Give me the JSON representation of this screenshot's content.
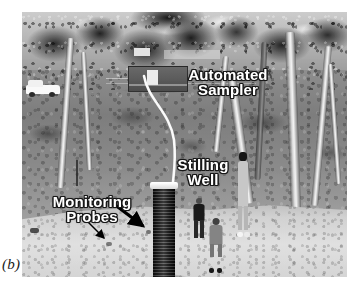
{
  "figure": {
    "sublabel": "(b)",
    "caption_labels": {
      "automated_sampler": "Automated\nSampler",
      "stilling_well": "Stilling\nWell",
      "monitoring_probes": "Monitoring\nProbes"
    }
  },
  "photo": {
    "description": "Grayscale field photograph of a river bank monitoring site with eucalyptus trees, sandy foreground, a dark ribbed stilling well cylinder, two people standing on the sand, a white vehicle at left, and an automated sampler enclosure in the mid-ground.",
    "palette": {
      "sky": "#e8e8e8",
      "canopy": "#242424",
      "bank": "#8a8a8a",
      "sand": "#d6d6d6",
      "well": "#1b1b1b",
      "label_text": "#ffffff",
      "label_outline": "#1c1c1c",
      "arrow": "#000000"
    }
  },
  "annotations": {
    "arrow_thick": {
      "name": "probes-arrow-thick",
      "from_x": 84,
      "from_y": 186,
      "to_x": 124,
      "to_y": 217
    },
    "arrow_thin": {
      "name": "probes-arrow-thin",
      "from_x": 62,
      "from_y": 206,
      "to_x": 84,
      "to_y": 229
    }
  },
  "scene_objects": {
    "vehicle": "white-four-wheel-drive",
    "sampler_enclosure": "automated-sampler-cabinet",
    "stilling_well": "ribbed-dark-standpipe-with-white-cap",
    "people": [
      "standing-person-dark-shirt",
      "standing-person-light-shirt",
      "person-by-tree"
    ]
  }
}
